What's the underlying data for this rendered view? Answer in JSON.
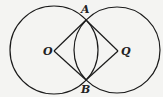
{
  "diagram": {
    "type": "geometry",
    "points": {
      "O": {
        "label": "O",
        "x": 54,
        "y": 51
      },
      "Q": {
        "label": "Q",
        "x": 118,
        "y": 51
      },
      "A": {
        "label": "A",
        "x": 86,
        "y": 20
      },
      "B": {
        "label": "B",
        "x": 86,
        "y": 80
      }
    },
    "circles": [
      {
        "name": "circle-O",
        "cx": 54,
        "cy": 50,
        "r": 44
      },
      {
        "name": "circle-Q",
        "cx": 117,
        "cy": 50,
        "r": 43
      }
    ],
    "segments": [
      [
        "O",
        "A"
      ],
      [
        "A",
        "Q"
      ],
      [
        "Q",
        "B"
      ],
      [
        "B",
        "O"
      ]
    ],
    "colors": {
      "stroke": "#1a1a1a",
      "background": "#f4f4f2"
    }
  }
}
